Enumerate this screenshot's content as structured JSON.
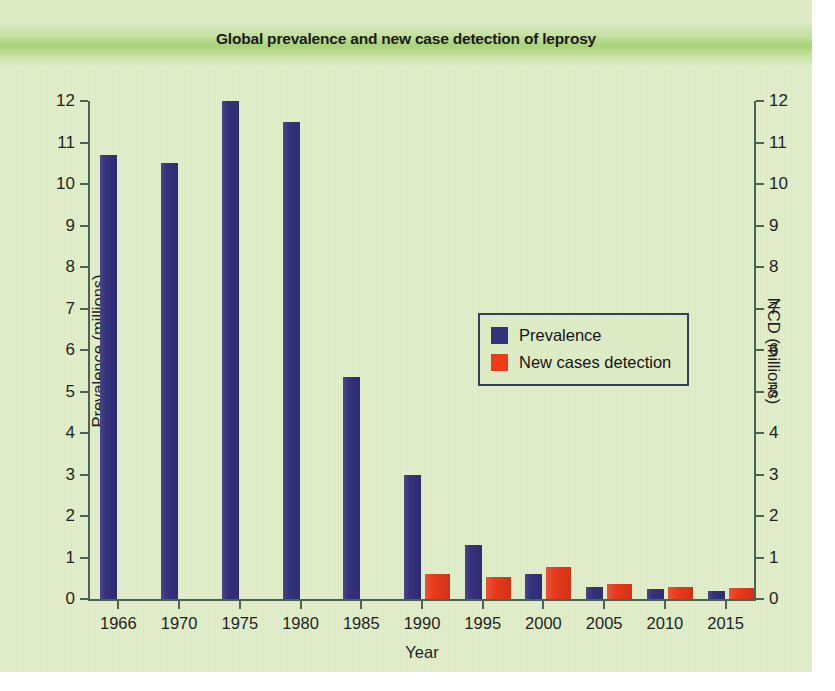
{
  "chart_data": {
    "type": "bar",
    "title": "Global prevalence and new case detection of leprosy",
    "xlabel": "Year",
    "ylabel": "Prevalence (millions)",
    "y2label": "NCD (millions)",
    "categories": [
      "1966",
      "1970",
      "1975",
      "1980",
      "1985",
      "1990",
      "1995",
      "2000",
      "2005",
      "2010",
      "2015"
    ],
    "ylim": [
      0,
      12
    ],
    "y2lim": [
      0,
      12
    ],
    "yticks": [
      "12",
      "11",
      "10",
      "9",
      "8",
      "7",
      "6",
      "5",
      "4",
      "3",
      "2",
      "1",
      "0"
    ],
    "y2ticks": [
      "12",
      "11",
      "10",
      "9",
      "8",
      "7",
      "6",
      "5",
      "4",
      "3",
      "2",
      "1",
      "0"
    ],
    "grid": false,
    "legend_position": "center-right",
    "series": [
      {
        "name": "Prevalence",
        "color": "#33327c",
        "axis": "left",
        "values": [
          10.7,
          10.5,
          12.0,
          11.5,
          5.35,
          3.0,
          1.3,
          0.6,
          0.3,
          0.25,
          0.2
        ]
      },
      {
        "name": "New cases detection",
        "color": "#e8381a",
        "axis": "right",
        "values": [
          null,
          null,
          null,
          null,
          null,
          0.6,
          0.53,
          0.76,
          0.35,
          0.28,
          0.26
        ]
      }
    ]
  },
  "legend": {
    "entries": [
      {
        "label": "Prevalence",
        "swatch": "prevalence"
      },
      {
        "label": "New cases detection",
        "swatch": "ncd"
      }
    ]
  },
  "colors": {
    "prevalence": "#33327c",
    "new_cases_detection": "#e8381a",
    "canvas_background": "#dcebc3",
    "axis": "#4b6350",
    "legend_border": "#33405c"
  }
}
